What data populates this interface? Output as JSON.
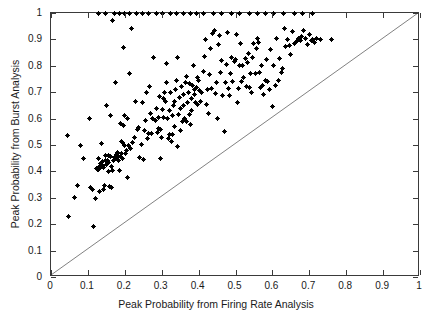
{
  "figure": {
    "width": 432,
    "height": 327,
    "background": "#ffffff",
    "foreground": "#000000",
    "axis_color": "#3a3a3a"
  },
  "chart_data": {
    "type": "scatter",
    "title": "",
    "xlabel": "Peak Probability from Firing Rate Analysis",
    "ylabel": "Peak Probability from Burst Analysis",
    "xlim": [
      0,
      1
    ],
    "ylim": [
      0,
      1
    ],
    "grid": false,
    "legend": null,
    "marker": "plus",
    "marker_color": "#000000",
    "marker_size": 5,
    "xticks": [
      0,
      0.1,
      0.2,
      0.3,
      0.4,
      0.5,
      0.6,
      0.7,
      0.8,
      0.9,
      1
    ],
    "yticks": [
      0,
      0.1,
      0.2,
      0.3,
      0.4,
      0.5,
      0.6,
      0.7,
      0.8,
      0.9,
      1
    ],
    "xticklabels": [
      "0",
      "0.1",
      "0.2",
      "0.3",
      "0.4",
      "0.5",
      "0.6",
      "0.7",
      "0.8",
      "0.9",
      "1"
    ],
    "yticklabels": [
      "0",
      "0.1",
      "0.2",
      "0.3",
      "0.4",
      "0.5",
      "0.6",
      "0.7",
      "0.8",
      "0.9",
      "1"
    ],
    "annotations": [
      {
        "kind": "line",
        "name": "identity-line",
        "from": [
          0,
          0
        ],
        "to": [
          1,
          1
        ],
        "color": "#4a4a4a",
        "width": 0.7
      }
    ],
    "series": [
      {
        "name": "neurons",
        "n_points": 268,
        "x": [
          0.045,
          0.047,
          0.063,
          0.072,
          0.079,
          0.088,
          0.104,
          0.108,
          0.112,
          0.116,
          0.121,
          0.124,
          0.127,
          0.129,
          0.129,
          0.131,
          0.132,
          0.133,
          0.134,
          0.136,
          0.138,
          0.139,
          0.14,
          0.142,
          0.143,
          0.145,
          0.147,
          0.148,
          0.15,
          0.151,
          0.153,
          0.155,
          0.156,
          0.157,
          0.159,
          0.16,
          0.162,
          0.163,
          0.165,
          0.166,
          0.168,
          0.17,
          0.172,
          0.174,
          0.175,
          0.177,
          0.179,
          0.181,
          0.183,
          0.185,
          0.187,
          0.188,
          0.19,
          0.191,
          0.193,
          0.194,
          0.196,
          0.197,
          0.199,
          0.2,
          0.202,
          0.204,
          0.206,
          0.208,
          0.21,
          0.213,
          0.216,
          0.219,
          0.222,
          0.226,
          0.23,
          0.234,
          0.238,
          0.241,
          0.244,
          0.247,
          0.25,
          0.253,
          0.256,
          0.259,
          0.262,
          0.265,
          0.268,
          0.27,
          0.273,
          0.276,
          0.279,
          0.282,
          0.285,
          0.288,
          0.29,
          0.292,
          0.294,
          0.296,
          0.298,
          0.3,
          0.302,
          0.304,
          0.306,
          0.308,
          0.31,
          0.312,
          0.314,
          0.316,
          0.318,
          0.32,
          0.322,
          0.324,
          0.326,
          0.328,
          0.33,
          0.332,
          0.334,
          0.336,
          0.338,
          0.34,
          0.342,
          0.344,
          0.346,
          0.348,
          0.35,
          0.352,
          0.354,
          0.356,
          0.358,
          0.36,
          0.362,
          0.364,
          0.366,
          0.368,
          0.37,
          0.372,
          0.374,
          0.376,
          0.378,
          0.38,
          0.382,
          0.384,
          0.386,
          0.388,
          0.39,
          0.392,
          0.394,
          0.396,
          0.398,
          0.4,
          0.403,
          0.406,
          0.409,
          0.412,
          0.415,
          0.418,
          0.421,
          0.424,
          0.427,
          0.43,
          0.433,
          0.436,
          0.439,
          0.442,
          0.445,
          0.448,
          0.451,
          0.454,
          0.457,
          0.46,
          0.463,
          0.466,
          0.469,
          0.472,
          0.475,
          0.478,
          0.481,
          0.484,
          0.487,
          0.49,
          0.493,
          0.496,
          0.499,
          0.502,
          0.505,
          0.508,
          0.511,
          0.514,
          0.517,
          0.52,
          0.523,
          0.526,
          0.529,
          0.532,
          0.535,
          0.538,
          0.541,
          0.544,
          0.547,
          0.55,
          0.553,
          0.556,
          0.559,
          0.562,
          0.565,
          0.568,
          0.571,
          0.574,
          0.577,
          0.58,
          0.584,
          0.588,
          0.592,
          0.596,
          0.6,
          0.604,
          0.608,
          0.612,
          0.616,
          0.62,
          0.624,
          0.628,
          0.632,
          0.636,
          0.64,
          0.645,
          0.65,
          0.655,
          0.66,
          0.665,
          0.67,
          0.675,
          0.68,
          0.685,
          0.69,
          0.695,
          0.7,
          0.705,
          0.71,
          0.715,
          0.72,
          0.73,
          0.76,
          0.128,
          0.148,
          0.171,
          0.186,
          0.199,
          0.213,
          0.231,
          0.249,
          0.263,
          0.287,
          0.301,
          0.323,
          0.341,
          0.359,
          0.377,
          0.395,
          0.413,
          0.441,
          0.463,
          0.489,
          0.511,
          0.537,
          0.559,
          0.581,
          0.603,
          0.631,
          0.659,
          0.681,
          0.709
        ],
        "y": [
          0.537,
          0.228,
          0.3,
          0.345,
          0.5,
          0.447,
          0.6,
          0.34,
          0.33,
          0.193,
          0.296,
          0.411,
          0.409,
          0.408,
          0.448,
          0.325,
          0.42,
          0.415,
          0.43,
          0.505,
          0.425,
          0.422,
          0.437,
          0.332,
          0.415,
          0.348,
          0.462,
          0.44,
          0.427,
          0.65,
          0.44,
          0.4,
          0.435,
          0.46,
          0.344,
          0.61,
          0.455,
          0.419,
          0.34,
          0.97,
          0.405,
          0.441,
          0.452,
          0.735,
          0.448,
          0.463,
          0.457,
          0.47,
          0.44,
          0.404,
          0.58,
          0.455,
          0.466,
          0.513,
          0.448,
          0.511,
          0.87,
          0.572,
          0.497,
          0.61,
          0.466,
          0.478,
          0.6,
          0.377,
          0.497,
          0.77,
          0.487,
          0.94,
          0.51,
          0.53,
          0.665,
          0.56,
          0.565,
          0.453,
          0.501,
          0.66,
          0.445,
          0.554,
          0.594,
          0.7,
          0.525,
          0.543,
          0.72,
          0.62,
          0.544,
          0.6,
          0.83,
          0.594,
          0.64,
          0.547,
          0.561,
          0.603,
          0.684,
          0.56,
          0.45,
          0.53,
          0.633,
          0.606,
          0.675,
          0.7,
          0.665,
          0.735,
          0.81,
          0.6,
          0.524,
          0.541,
          0.632,
          0.7,
          0.513,
          0.611,
          0.54,
          0.649,
          0.57,
          0.663,
          0.709,
          0.745,
          0.83,
          0.495,
          0.617,
          0.68,
          0.555,
          0.64,
          0.721,
          0.588,
          0.648,
          0.69,
          0.6,
          0.737,
          0.758,
          0.588,
          0.66,
          0.7,
          0.734,
          0.615,
          0.578,
          0.631,
          0.676,
          0.727,
          0.8,
          0.692,
          0.71,
          0.66,
          0.718,
          0.655,
          0.754,
          0.744,
          0.706,
          0.664,
          0.7,
          0.78,
          0.836,
          0.901,
          0.655,
          0.712,
          0.619,
          0.766,
          0.865,
          0.715,
          0.921,
          0.933,
          0.694,
          0.738,
          0.6,
          0.881,
          0.915,
          0.776,
          0.82,
          0.688,
          0.551,
          0.735,
          0.805,
          0.925,
          0.713,
          0.688,
          0.772,
          0.83,
          0.741,
          0.815,
          0.823,
          0.92,
          0.661,
          0.713,
          0.8,
          0.884,
          0.739,
          0.8,
          0.755,
          0.826,
          0.72,
          0.813,
          0.845,
          0.716,
          0.772,
          0.7,
          0.831,
          0.886,
          0.77,
          0.866,
          0.905,
          0.888,
          0.773,
          0.718,
          0.8,
          0.724,
          0.693,
          0.744,
          0.823,
          0.742,
          0.712,
          0.86,
          0.645,
          0.8,
          0.725,
          0.902,
          0.745,
          0.828,
          0.773,
          0.789,
          0.942,
          0.875,
          0.9,
          0.877,
          0.843,
          0.93,
          0.885,
          0.891,
          0.903,
          0.895,
          0.91,
          0.935,
          0.902,
          0.88,
          0.92,
          0.895,
          0.9,
          0.89,
          0.905,
          0.899,
          0.9,
          1.0,
          1.0,
          1.0,
          1.0,
          1.0,
          1.0,
          1.0,
          1.0,
          1.0,
          1.0,
          1.0,
          1.0,
          1.0,
          1.0,
          1.0,
          1.0,
          1.0,
          1.0,
          1.0,
          1.0,
          1.0,
          1.0,
          1.0,
          1.0,
          1.0,
          1.0,
          1.0,
          1.0,
          1.0
        ]
      }
    ]
  }
}
